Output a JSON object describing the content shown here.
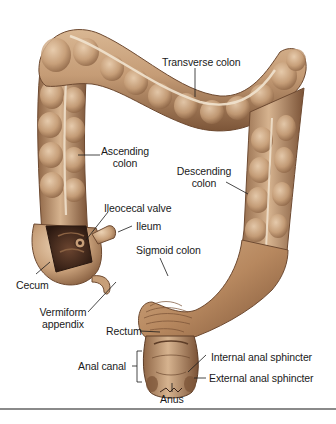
{
  "figure": {
    "colors": {
      "tissue_base": "#c9a27e",
      "tissue_light": "#e2c4a3",
      "tissue_dark": "#8a6243",
      "tissue_shadow": "#5e3e28",
      "taenia_highlight": "#f1e3cf",
      "cavity": "#3a241a",
      "label_text": "#1a1a1a",
      "leader_line": "#1a1a1a",
      "rule": "#8a8a8a"
    },
    "labels": {
      "transverse_colon": "Transverse colon",
      "ascending_colon_1": "Ascending",
      "ascending_colon_2": "colon",
      "descending_colon_1": "Descending",
      "descending_colon_2": "colon",
      "ileocecal_valve": "Ileocecal valve",
      "ileum": "Ileum",
      "sigmoid_colon": "Sigmoid colon",
      "cecum": "Cecum",
      "vermiform_appendix_1": "Vermiform",
      "vermiform_appendix_2": "appendix",
      "rectum": "Rectum",
      "anal_canal": "Anal canal",
      "internal_anal_sphincter": "Internal anal sphincter",
      "external_anal_sphincter": "External anal sphincter",
      "anus": "Anus"
    }
  }
}
